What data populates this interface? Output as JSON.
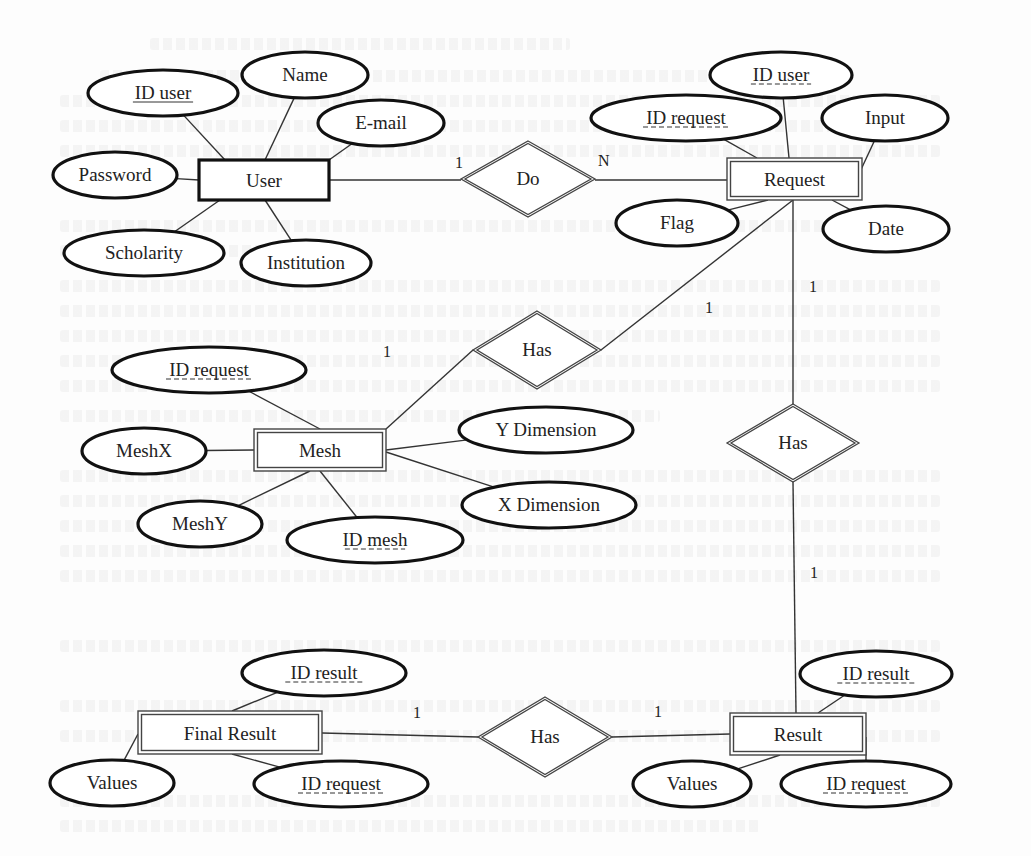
{
  "diagram": {
    "type": "entity-relationship",
    "entities": [
      {
        "id": "user",
        "label": "User",
        "kind": "strong",
        "x": 199,
        "y": 160,
        "w": 130,
        "h": 40
      },
      {
        "id": "request",
        "label": "Request",
        "kind": "weak",
        "x": 727,
        "y": 158,
        "w": 135,
        "h": 42
      },
      {
        "id": "mesh",
        "label": "Mesh",
        "kind": "weak",
        "x": 254,
        "y": 429,
        "w": 132,
        "h": 42
      },
      {
        "id": "final_result",
        "label": "Final Result",
        "kind": "weak",
        "x": 138,
        "y": 711,
        "w": 184,
        "h": 43
      },
      {
        "id": "result",
        "label": "Result",
        "kind": "weak",
        "x": 730,
        "y": 713,
        "w": 136,
        "h": 42
      }
    ],
    "relationships": [
      {
        "id": "do",
        "label": "Do",
        "cx": 528,
        "cy": 179,
        "hw": 67,
        "hh": 38
      },
      {
        "id": "has_request_mesh",
        "label": "Has",
        "cx": 537,
        "cy": 350,
        "hw": 64,
        "hh": 39
      },
      {
        "id": "has_request_result",
        "label": "Has",
        "cx": 793,
        "cy": 443,
        "hw": 66,
        "hh": 39
      },
      {
        "id": "has_result_final",
        "label": "Has",
        "cx": 545,
        "cy": 737,
        "hw": 67,
        "hh": 40
      }
    ],
    "attributes": [
      {
        "id": "user_id_user",
        "label": "ID user",
        "key": "primary",
        "cx": 163,
        "cy": 93,
        "rx": 75,
        "ry": 23,
        "to": [
          225,
          160
        ]
      },
      {
        "id": "user_name",
        "label": "Name",
        "cx": 305,
        "cy": 75,
        "rx": 63,
        "ry": 23,
        "to": [
          265,
          160
        ]
      },
      {
        "id": "user_email",
        "label": "E-mail",
        "cx": 381,
        "cy": 123,
        "rx": 63,
        "ry": 23,
        "to": [
          329,
          160
        ]
      },
      {
        "id": "user_password",
        "label": "Password",
        "cx": 115,
        "cy": 175,
        "rx": 62,
        "ry": 23,
        "to": [
          199,
          180
        ]
      },
      {
        "id": "user_scholarity",
        "label": "Scholarity",
        "cx": 144,
        "cy": 253,
        "rx": 80,
        "ry": 23,
        "to": [
          220,
          200
        ]
      },
      {
        "id": "user_institution",
        "label": "Institution",
        "cx": 306,
        "cy": 263,
        "rx": 65,
        "ry": 23,
        "to": [
          265,
          200
        ]
      },
      {
        "id": "request_id_user",
        "label": "ID user",
        "key": "partial",
        "cx": 781,
        "cy": 75,
        "rx": 71,
        "ry": 23,
        "to": [
          789,
          158
        ]
      },
      {
        "id": "request_id_request",
        "label": "ID request",
        "key": "partial",
        "cx": 686,
        "cy": 118,
        "rx": 95,
        "ry": 23,
        "to": [
          757,
          158
        ]
      },
      {
        "id": "request_input",
        "label": "Input",
        "cx": 885,
        "cy": 118,
        "rx": 63,
        "ry": 23,
        "to": [
          858,
          176
        ]
      },
      {
        "id": "request_flag",
        "label": "Flag",
        "cx": 677,
        "cy": 223,
        "rx": 61,
        "ry": 23,
        "to": [
          768,
          200
        ]
      },
      {
        "id": "request_date",
        "label": "Date",
        "cx": 886,
        "cy": 229,
        "rx": 63,
        "ry": 23,
        "to": [
          832,
          200
        ]
      },
      {
        "id": "mesh_id_request",
        "label": "ID request",
        "key": "partial",
        "cx": 209,
        "cy": 370,
        "rx": 97,
        "ry": 23,
        "to": [
          320,
          429
        ]
      },
      {
        "id": "mesh_meshx",
        "label": "MeshX",
        "cx": 144,
        "cy": 451,
        "rx": 62,
        "ry": 23,
        "to": [
          254,
          450
        ]
      },
      {
        "id": "mesh_y_dimension",
        "label": "Y Dimension",
        "cx": 546,
        "cy": 430,
        "rx": 87,
        "ry": 23,
        "to": [
          386,
          450
        ]
      },
      {
        "id": "mesh_x_dimension",
        "label": "X Dimension",
        "cx": 549,
        "cy": 505,
        "rx": 87,
        "ry": 23,
        "to": [
          386,
          452
        ]
      },
      {
        "id": "mesh_meshy",
        "label": "MeshY",
        "cx": 200,
        "cy": 524,
        "rx": 62,
        "ry": 23,
        "to": [
          310,
          471
        ]
      },
      {
        "id": "mesh_id_mesh",
        "label": "ID mesh",
        "key": "partial",
        "cx": 375,
        "cy": 540,
        "rx": 88,
        "ry": 23,
        "to": [
          320,
          471
        ]
      },
      {
        "id": "final_id_result",
        "label": "ID result",
        "key": "partial",
        "cx": 324,
        "cy": 673,
        "rx": 82,
        "ry": 23,
        "to": [
          232,
          711
        ]
      },
      {
        "id": "final_values",
        "label": "Values",
        "cx": 112,
        "cy": 783,
        "rx": 62,
        "ry": 23,
        "to": [
          138,
          734
        ]
      },
      {
        "id": "final_id_request",
        "label": "ID request",
        "key": "partial",
        "cx": 341,
        "cy": 784,
        "rx": 87,
        "ry": 23,
        "to": [
          232,
          754
        ]
      },
      {
        "id": "result_id_result",
        "label": "ID result",
        "key": "partial",
        "cx": 876,
        "cy": 674,
        "rx": 76,
        "ry": 23,
        "to": [
          818,
          713
        ]
      },
      {
        "id": "result_values",
        "label": "Values",
        "cx": 692,
        "cy": 784,
        "rx": 59,
        "ry": 23,
        "to": [
          780,
          755
        ]
      },
      {
        "id": "result_id_request",
        "label": "ID request",
        "key": "partial",
        "cx": 866,
        "cy": 784,
        "rx": 85,
        "ry": 23,
        "to": [
          866,
          737
        ]
      }
    ],
    "links": [
      {
        "from": [
          329,
          180
        ],
        "to": [
          461,
          180
        ],
        "card": "1",
        "card_x": 455,
        "card_y": 168
      },
      {
        "from": [
          595,
          180
        ],
        "to": [
          727,
          180
        ],
        "card": "N",
        "card_x": 598,
        "card_y": 166
      },
      {
        "from": [
          386,
          429
        ],
        "to": [
          473,
          350
        ],
        "card": "1",
        "card_x": 383,
        "card_y": 357
      },
      {
        "from": [
          601,
          350
        ],
        "to": [
          793,
          200
        ],
        "card": "1",
        "card_x": 705,
        "card_y": 313
      },
      {
        "from": [
          793,
          200
        ],
        "to": [
          793,
          405
        ],
        "card": "1",
        "card_x": 809,
        "card_y": 292
      },
      {
        "from": [
          793,
          482
        ],
        "to": [
          796,
          713
        ],
        "card": "1",
        "card_x": 810,
        "card_y": 578
      },
      {
        "from": [
          322,
          733
        ],
        "to": [
          478,
          737
        ],
        "card": "1",
        "card_x": 413,
        "card_y": 718
      },
      {
        "from": [
          612,
          737
        ],
        "to": [
          730,
          734
        ],
        "card": "1",
        "card_x": 654,
        "card_y": 717
      }
    ]
  }
}
